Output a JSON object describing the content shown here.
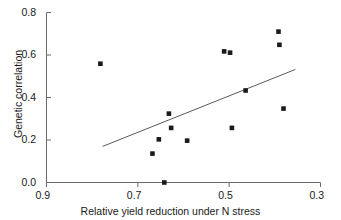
{
  "chart_data": {
    "type": "scatter",
    "title": "",
    "xlabel": "Relative yield reduction under N stress",
    "ylabel": "Genetic correlation",
    "xlim": [
      0.9,
      0.3
    ],
    "ylim": [
      0.0,
      0.8
    ],
    "x_reversed": true,
    "grid": false,
    "legend": null,
    "xticks": [
      "0.9",
      "0.7",
      "0.5",
      "0.3"
    ],
    "xtick_values": [
      0.9,
      0.7,
      0.5,
      0.3
    ],
    "yticks": [
      "0.0",
      "0.2",
      "0.4",
      "0.6",
      "0.8"
    ],
    "ytick_values": [
      0.0,
      0.2,
      0.4,
      0.6,
      0.8
    ],
    "series": [
      {
        "name": "Genotype pairs",
        "marker": "square",
        "color": "#1a1a1a",
        "points": [
          {
            "x": 0.782,
            "y": 0.559
          },
          {
            "x": 0.668,
            "y": 0.136
          },
          {
            "x": 0.654,
            "y": 0.203
          },
          {
            "x": 0.642,
            "y": 0.0
          },
          {
            "x": 0.632,
            "y": 0.324
          },
          {
            "x": 0.627,
            "y": 0.257
          },
          {
            "x": 0.592,
            "y": 0.197
          },
          {
            "x": 0.511,
            "y": 0.617
          },
          {
            "x": 0.498,
            "y": 0.611
          },
          {
            "x": 0.494,
            "y": 0.257
          },
          {
            "x": 0.464,
            "y": 0.433
          },
          {
            "x": 0.392,
            "y": 0.71
          },
          {
            "x": 0.39,
            "y": 0.648
          },
          {
            "x": 0.381,
            "y": 0.348
          }
        ]
      }
    ],
    "annotations": [
      {
        "type": "regression-line",
        "color": "#5a5a5a",
        "x_start": 0.777,
        "y_start": 0.17,
        "x_end": 0.355,
        "y_end": 0.532
      }
    ]
  }
}
